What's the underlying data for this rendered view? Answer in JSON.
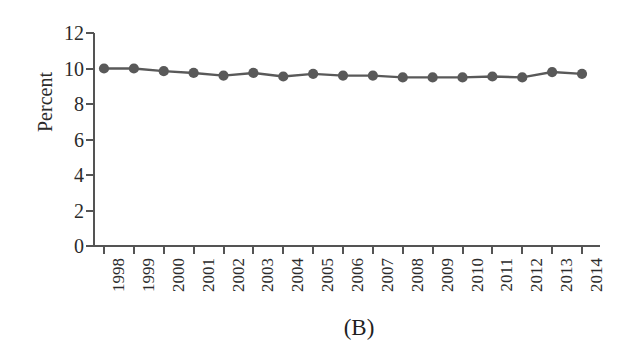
{
  "chart_data": {
    "type": "line",
    "title": "",
    "subtitle": "",
    "panel_label": "(B)",
    "xlabel": "",
    "ylabel": "Percent",
    "grid": false,
    "legend": null,
    "xlim": [
      1998,
      2014
    ],
    "ylim": [
      0,
      12
    ],
    "ytick_labels": [
      "12",
      "10",
      "8",
      "6",
      "4",
      "2",
      "0"
    ],
    "ytick_values": [
      12,
      10,
      8,
      6,
      4,
      2,
      0
    ],
    "categories": [
      "1998",
      "1999",
      "2000",
      "2001",
      "2002",
      "2003",
      "2004",
      "2005",
      "2006",
      "2007",
      "2008",
      "2009",
      "2010",
      "2011",
      "2012",
      "2013",
      "2014"
    ],
    "values": [
      10.0,
      10.0,
      9.85,
      9.75,
      9.6,
      9.75,
      9.55,
      9.7,
      9.6,
      9.6,
      9.5,
      9.5,
      9.5,
      9.55,
      9.5,
      9.8,
      9.7
    ],
    "series": [
      {
        "name": "Percent",
        "color": "#595959",
        "marker": "circle",
        "values": [
          10.0,
          10.0,
          9.85,
          9.75,
          9.6,
          9.75,
          9.55,
          9.7,
          9.6,
          9.6,
          9.5,
          9.5,
          9.5,
          9.55,
          9.5,
          9.8,
          9.7
        ]
      }
    ],
    "annotations": []
  },
  "axes": {
    "y_title": "Percent",
    "y_labels": [
      "12",
      "10",
      "8",
      "6",
      "4",
      "2",
      "0"
    ],
    "x_labels": [
      "1998",
      "1999",
      "2000",
      "2001",
      "2002",
      "2003",
      "2004",
      "2005",
      "2006",
      "2007",
      "2008",
      "2009",
      "2010",
      "2011",
      "2012",
      "2013",
      "2014"
    ]
  },
  "figure": {
    "panel_label": "(B)",
    "background": "#ffffff",
    "axis_color": "#545454",
    "series_color": "#595959"
  }
}
